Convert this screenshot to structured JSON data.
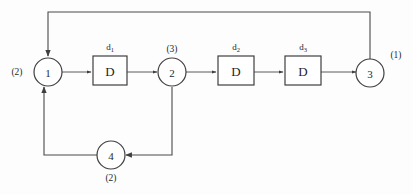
{
  "diagram": {
    "colors": {
      "background": "#fdfdfd",
      "stroke": "#3f3f3f",
      "text": "#1f1f1f"
    },
    "nodes": [
      {
        "id": "node-1",
        "label": "1",
        "weight": "(2)",
        "weight_position": "left"
      },
      {
        "id": "node-2",
        "label": "2",
        "weight": "(3)",
        "weight_position": "top"
      },
      {
        "id": "node-3",
        "label": "3",
        "weight": "(1)",
        "weight_position": "top-right"
      },
      {
        "id": "node-4",
        "label": "4",
        "weight": "(2)",
        "weight_position": "bottom"
      }
    ],
    "delay_blocks": [
      {
        "id": "delay-1",
        "label": "D",
        "name_base": "d",
        "name_sub": "1"
      },
      {
        "id": "delay-2",
        "label": "D",
        "name_base": "d",
        "name_sub": "2"
      },
      {
        "id": "delay-3",
        "label": "D",
        "name_base": "d",
        "name_sub": "3"
      }
    ],
    "edges": [
      {
        "id": "edge-node1-to-delay1",
        "from": "node-1",
        "to": "delay-1"
      },
      {
        "id": "edge-delay1-to-node2",
        "from": "delay-1",
        "to": "node-2"
      },
      {
        "id": "edge-node2-to-delay2",
        "from": "node-2",
        "to": "delay-2"
      },
      {
        "id": "edge-delay2-to-delay3",
        "from": "delay-2",
        "to": "delay-3"
      },
      {
        "id": "edge-delay3-to-node3",
        "from": "delay-3",
        "to": "node-3"
      },
      {
        "id": "edge-node3-to-node1-feedback",
        "from": "node-3",
        "to": "node-1"
      },
      {
        "id": "edge-node2-to-node4",
        "from": "node-2",
        "to": "node-4"
      },
      {
        "id": "edge-node4-to-node1",
        "from": "node-4",
        "to": "node-1"
      }
    ]
  }
}
